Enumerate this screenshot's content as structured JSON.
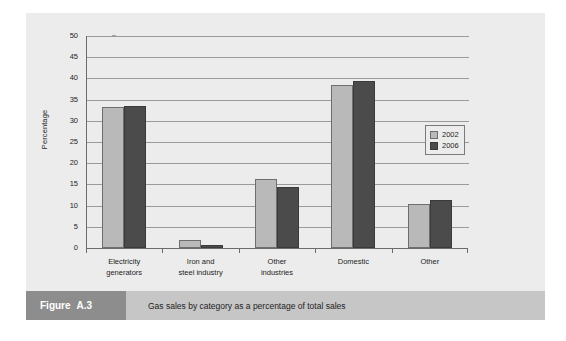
{
  "figure": {
    "label": "Figure",
    "number": "A.3",
    "caption": "Gas sales by category as a percentage of total sales"
  },
  "colors": {
    "series_2002": "#b9b9b9",
    "series_2006": "#4b4b4b",
    "panel_background": "#ececec",
    "caption_bar": "#c6c6c6",
    "caption_block": "#8d8d8d",
    "gridline": "#9a9a9a",
    "axis": "#6b6b6b"
  },
  "chart_data": {
    "type": "bar",
    "title": "",
    "xlabel": "",
    "ylabel": "Percentage",
    "ylim": [
      0,
      50
    ],
    "yticks": [
      0,
      5,
      10,
      15,
      20,
      25,
      30,
      35,
      40,
      45,
      50
    ],
    "ytick_labels": [
      "0",
      "5",
      "10",
      "15",
      "20",
      "25",
      "30",
      "35",
      "40",
      "45",
      "50"
    ],
    "grid": true,
    "legend_position": "right",
    "categories": [
      "Electricity generators",
      "Iron and steel industry",
      "Other industries",
      "Domestic",
      "Other"
    ],
    "category_label_lines": [
      [
        "Electricity",
        "generators"
      ],
      [
        "Iron and",
        "steel industry"
      ],
      [
        "Other",
        "industries"
      ],
      [
        "Domestic"
      ],
      [
        "Other"
      ]
    ],
    "series": [
      {
        "name": "2002",
        "color": "#b9b9b9",
        "values": [
          33.2,
          2.0,
          16.3,
          38.4,
          10.3
        ]
      },
      {
        "name": "2006",
        "color": "#4b4b4b",
        "values": [
          33.5,
          0.8,
          14.5,
          39.5,
          11.3
        ]
      }
    ]
  }
}
